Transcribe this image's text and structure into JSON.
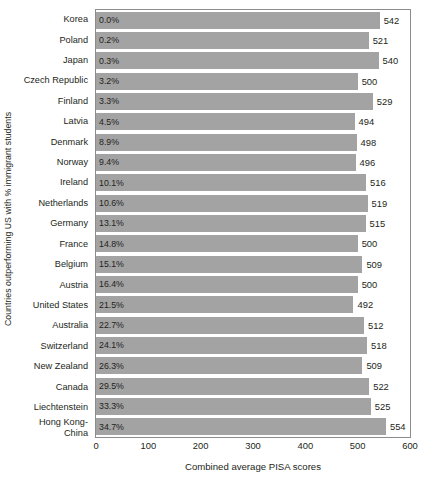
{
  "chart_data": {
    "type": "bar",
    "orientation": "horizontal",
    "title": "",
    "xlabel": "Combined average PISA scores",
    "ylabel": "Countries outperforming US with % immigrant students",
    "xlim": [
      0,
      600
    ],
    "xticks": [
      0,
      100,
      200,
      300,
      400,
      500,
      600
    ],
    "grid": false,
    "legend": null,
    "bar_color": "#a3a3a3",
    "categories": [
      "Korea",
      "Poland",
      "Japan",
      "Czech Republic",
      "Finland",
      "Latvia",
      "Denmark",
      "Norway",
      "Ireland",
      "Netherlands",
      "Germany",
      "France",
      "Belgium",
      "Austria",
      "United States",
      "Australia",
      "Switzerland",
      "New Zealand",
      "Canada",
      "Liechtenstein",
      "Hong Kong-\nChina"
    ],
    "values": [
      542,
      521,
      540,
      500,
      529,
      494,
      498,
      496,
      516,
      519,
      515,
      500,
      509,
      500,
      492,
      512,
      518,
      509,
      522,
      525,
      554
    ],
    "point_labels": [
      "0.0%",
      "0.2%",
      "0.3%",
      "3.2%",
      "3.3%",
      "4.5%",
      "8.9%",
      "9.4%",
      "10.1%",
      "10.6%",
      "13.1%",
      "14.8%",
      "15.1%",
      "16.4%",
      "21.5%",
      "22.7%",
      "24.1%",
      "26.3%",
      "29.5%",
      "33.3%",
      "34.7%"
    ],
    "point_labels_name": "percent immigrant students",
    "rows": [
      {
        "category": "Korea",
        "percent": "0.0%",
        "score": 542
      },
      {
        "category": "Poland",
        "percent": "0.2%",
        "score": 521
      },
      {
        "category": "Japan",
        "percent": "0.3%",
        "score": 540
      },
      {
        "category": "Czech Republic",
        "percent": "3.2%",
        "score": 500
      },
      {
        "category": "Finland",
        "percent": "3.3%",
        "score": 529
      },
      {
        "category": "Latvia",
        "percent": "4.5%",
        "score": 494
      },
      {
        "category": "Denmark",
        "percent": "8.9%",
        "score": 498
      },
      {
        "category": "Norway",
        "percent": "9.4%",
        "score": 496
      },
      {
        "category": "Ireland",
        "percent": "10.1%",
        "score": 516
      },
      {
        "category": "Netherlands",
        "percent": "10.6%",
        "score": 519
      },
      {
        "category": "Germany",
        "percent": "13.1%",
        "score": 515
      },
      {
        "category": "France",
        "percent": "14.8%",
        "score": 500
      },
      {
        "category": "Belgium",
        "percent": "15.1%",
        "score": 509
      },
      {
        "category": "Austria",
        "percent": "16.4%",
        "score": 500
      },
      {
        "category": "United States",
        "percent": "21.5%",
        "score": 492
      },
      {
        "category": "Australia",
        "percent": "22.7%",
        "score": 512
      },
      {
        "category": "Switzerland",
        "percent": "24.1%",
        "score": 518
      },
      {
        "category": "New Zealand",
        "percent": "26.3%",
        "score": 509
      },
      {
        "category": "Canada",
        "percent": "29.5%",
        "score": 522
      },
      {
        "category": "Liechtenstein",
        "percent": "33.3%",
        "score": 525
      },
      {
        "category": "Hong Kong-\nChina",
        "percent": "34.7%",
        "score": 554
      }
    ]
  }
}
